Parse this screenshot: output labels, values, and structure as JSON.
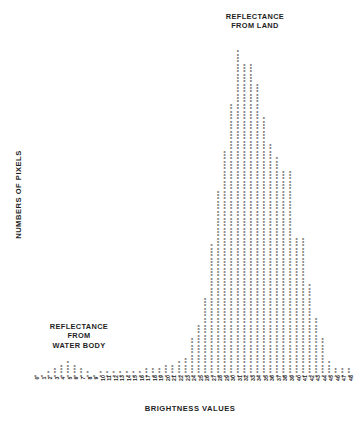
{
  "annotations": {
    "land_label": "REFLECTANCE\nFROM LAND",
    "water_label": "REFLECTANCE\nFROM\nWATER BODY"
  },
  "axes": {
    "x_title": "BRIGHTNESS VALUES",
    "y_title": "NUMBERS OF PIXELS"
  },
  "style": {
    "mark_char": "X",
    "mark_color": "#252525",
    "background": "#ffffff",
    "text_color": "#1f1f1f"
  },
  "chart_data": {
    "type": "bar",
    "title": "",
    "subtitle": "",
    "xlabel": "BRIGHTNESS VALUES",
    "ylabel": "NUMBERS OF PIXELS",
    "grid": false,
    "legend": "none",
    "annotations": [
      {
        "text": "REFLECTANCE FROM LAND",
        "position": "top-right"
      },
      {
        "text": "REFLECTANCE FROM WATER BODY",
        "position": "mid-left"
      }
    ],
    "xlim": [
      0,
      48
    ],
    "ylim": [
      0,
      100
    ],
    "categories": [
      "0",
      "1",
      "2",
      "3",
      "4",
      "5",
      "6",
      "7",
      "8",
      "9",
      "10",
      "11",
      "12",
      "13",
      "14",
      "15",
      "16",
      "17",
      "18",
      "19",
      "20",
      "21",
      "22",
      "23",
      "24",
      "25",
      "26",
      "27",
      "28",
      "29",
      "30",
      "31",
      "32",
      "33",
      "34",
      "35",
      "36",
      "37",
      "38",
      "39",
      "40",
      "41",
      "42",
      "43",
      "44",
      "45",
      "46",
      "47",
      "48"
    ],
    "values": [
      1,
      1,
      2,
      3,
      4,
      5,
      4,
      3,
      2,
      1,
      2,
      2,
      2,
      2,
      2,
      2,
      2,
      3,
      3,
      3,
      4,
      4,
      5,
      6,
      12,
      16,
      24,
      40,
      56,
      68,
      82,
      98,
      94,
      94,
      88,
      78,
      70,
      66,
      62,
      62,
      42,
      42,
      28,
      18,
      12,
      5,
      3,
      3,
      3
    ]
  }
}
